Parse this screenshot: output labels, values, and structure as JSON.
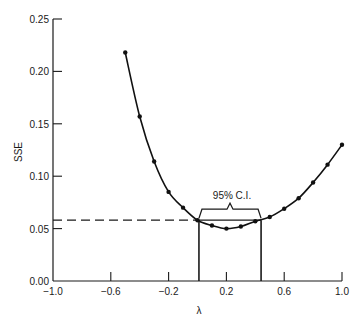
{
  "chart_data": {
    "type": "line",
    "title": "",
    "xlabel": "λ",
    "ylabel": "SSE",
    "xlim": [
      -1.0,
      1.0
    ],
    "ylim": [
      0.0,
      0.25
    ],
    "grid": false,
    "legend": null,
    "x_ticks": [
      "−1.0",
      "−0.6",
      "−0.2",
      "0.2",
      "0.6",
      "1.0"
    ],
    "y_ticks": [
      "0.00",
      "0.05",
      "0.10",
      "0.15",
      "0.20",
      "0.25"
    ],
    "series": [
      {
        "name": "SSE(λ)",
        "markers": true,
        "x": [
          -0.5,
          -0.4,
          -0.3,
          -0.2,
          -0.1,
          0.0,
          0.1,
          0.2,
          0.3,
          0.4,
          0.5,
          0.6,
          0.7,
          0.8,
          0.9,
          1.0
        ],
        "y": [
          0.218,
          0.157,
          0.114,
          0.085,
          0.07,
          0.058,
          0.053,
          0.05,
          0.052,
          0.057,
          0.061,
          0.069,
          0.079,
          0.094,
          0.111,
          0.13
        ]
      }
    ],
    "reference_lines": {
      "horizontal_dashed_sse": 0.058,
      "ci_lower_lambda": 0.01,
      "ci_upper_lambda": 0.44
    },
    "annotations": [
      {
        "text": "95% C.I.",
        "type": "brace",
        "x_from": 0.01,
        "x_to": 0.44
      }
    ]
  }
}
